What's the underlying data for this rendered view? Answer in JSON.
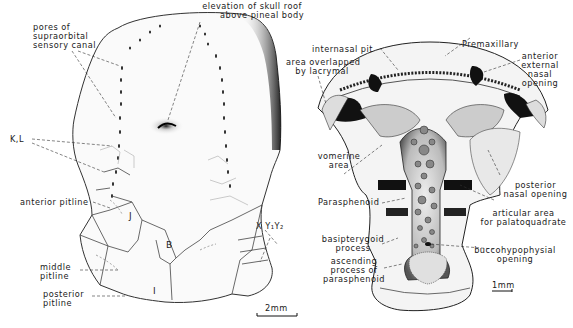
{
  "figure": {
    "left_panel": {
      "description": "Skull roof, dorsal view",
      "labels": {
        "supraorbital_line1": "pores of",
        "supraorbital_line2": "supraorbital",
        "supraorbital_line3": "sensory canal",
        "pineal_line1": "elevation of skull roof",
        "pineal_line2": "above pineal body",
        "kl": "K,L",
        "anterior_pitline": "anterior pitline",
        "j": "J",
        "b": "B",
        "i": "I",
        "xy": "X Y₁Y₂",
        "middle_pitline_1": "middle",
        "middle_pitline_2": "pitline",
        "posterior_pitline_1": "posterior",
        "posterior_pitline_2": "pitline"
      },
      "scale_bar": "2mm"
    },
    "right_panel": {
      "description": "Palate, ventral view",
      "labels": {
        "internasal_pit": "internasal pit",
        "lacrymal_1": "area overlapped",
        "lacrymal_2": "by lacrymal",
        "premaxillary": "Premaxillary",
        "ext_nasal_1": "anterior",
        "ext_nasal_2": "external",
        "ext_nasal_3": "nasal",
        "ext_nasal_4": "opening",
        "vomerine_1": "vomerine",
        "vomerine_2": "area",
        "parasphenoid": "Parasphenoid",
        "post_nasal_1": "posterior",
        "post_nasal_2": "nasal opening",
        "articular_1": "articular area",
        "articular_2": "for palatoquadrate",
        "basipterygoid_1": "basipterygoid",
        "basipterygoid_2": "process",
        "buccohyp_1": "buccohypophysial",
        "buccohyp_2": "opening",
        "ascending_1": "ascending",
        "ascending_2": "process of",
        "ascending_3": "parasphenoid"
      },
      "scale_bar": "1mm"
    }
  }
}
